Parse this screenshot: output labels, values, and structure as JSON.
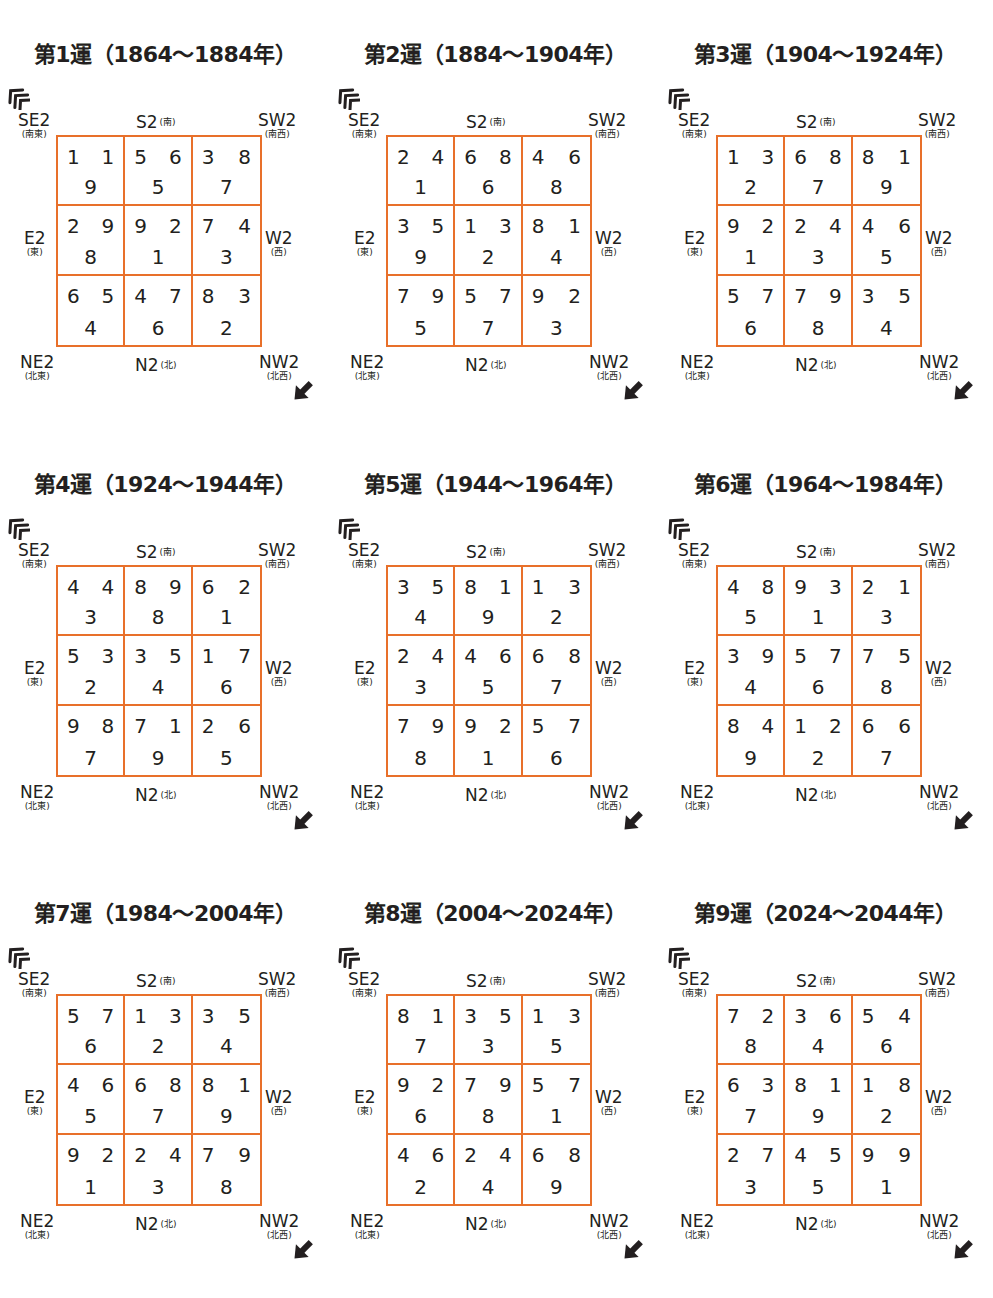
{
  "labels": {
    "se": {
      "en": "SE2",
      "jp": "(南東)"
    },
    "s": {
      "en": "S2",
      "jp": "(南)"
    },
    "sw": {
      "en": "SW2",
      "jp": "(南西)"
    },
    "e": {
      "en": "E2",
      "jp": "(東)"
    },
    "w": {
      "en": "W2",
      "jp": "(西)"
    },
    "ne": {
      "en": "NE2",
      "jp": "(北東)"
    },
    "n": {
      "en": "N2",
      "jp": "(北)"
    },
    "nw": {
      "en": "NW2",
      "jp": "(北西)"
    }
  },
  "colors": {
    "grid_line": "#e8702a",
    "text": "#231f20"
  },
  "icons": {
    "entrance": "entrance-chevron-icon",
    "exit": "diagonal-arrow-icon"
  },
  "periods": [
    {
      "title": "第1運（1864〜1884年）",
      "cells": [
        {
          "m": "1",
          "w": "1",
          "b": "9"
        },
        {
          "m": "5",
          "w": "6",
          "b": "5"
        },
        {
          "m": "3",
          "w": "8",
          "b": "7"
        },
        {
          "m": "2",
          "w": "9",
          "b": "8"
        },
        {
          "m": "9",
          "w": "2",
          "b": "1"
        },
        {
          "m": "7",
          "w": "4",
          "b": "3"
        },
        {
          "m": "6",
          "w": "5",
          "b": "4"
        },
        {
          "m": "4",
          "w": "7",
          "b": "6"
        },
        {
          "m": "8",
          "w": "3",
          "b": "2"
        }
      ]
    },
    {
      "title": "第2運（1884〜1904年）",
      "cells": [
        {
          "m": "2",
          "w": "4",
          "b": "1"
        },
        {
          "m": "6",
          "w": "8",
          "b": "6"
        },
        {
          "m": "4",
          "w": "6",
          "b": "8"
        },
        {
          "m": "3",
          "w": "5",
          "b": "9"
        },
        {
          "m": "1",
          "w": "3",
          "b": "2"
        },
        {
          "m": "8",
          "w": "1",
          "b": "4"
        },
        {
          "m": "7",
          "w": "9",
          "b": "5"
        },
        {
          "m": "5",
          "w": "7",
          "b": "7"
        },
        {
          "m": "9",
          "w": "2",
          "b": "3"
        }
      ]
    },
    {
      "title": "第3運（1904〜1924年）",
      "cells": [
        {
          "m": "1",
          "w": "3",
          "b": "2"
        },
        {
          "m": "6",
          "w": "8",
          "b": "7"
        },
        {
          "m": "8",
          "w": "1",
          "b": "9"
        },
        {
          "m": "9",
          "w": "2",
          "b": "1"
        },
        {
          "m": "2",
          "w": "4",
          "b": "3"
        },
        {
          "m": "4",
          "w": "6",
          "b": "5"
        },
        {
          "m": "5",
          "w": "7",
          "b": "6"
        },
        {
          "m": "7",
          "w": "9",
          "b": "8"
        },
        {
          "m": "3",
          "w": "5",
          "b": "4"
        }
      ]
    },
    {
      "title": "第4運（1924〜1944年）",
      "cells": [
        {
          "m": "4",
          "w": "4",
          "b": "3"
        },
        {
          "m": "8",
          "w": "9",
          "b": "8"
        },
        {
          "m": "6",
          "w": "2",
          "b": "1"
        },
        {
          "m": "5",
          "w": "3",
          "b": "2"
        },
        {
          "m": "3",
          "w": "5",
          "b": "4"
        },
        {
          "m": "1",
          "w": "7",
          "b": "6"
        },
        {
          "m": "9",
          "w": "8",
          "b": "7"
        },
        {
          "m": "7",
          "w": "1",
          "b": "9"
        },
        {
          "m": "2",
          "w": "6",
          "b": "5"
        }
      ]
    },
    {
      "title": "第5運（1944〜1964年）",
      "cells": [
        {
          "m": "3",
          "w": "5",
          "b": "4"
        },
        {
          "m": "8",
          "w": "1",
          "b": "9"
        },
        {
          "m": "1",
          "w": "3",
          "b": "2"
        },
        {
          "m": "2",
          "w": "4",
          "b": "3"
        },
        {
          "m": "4",
          "w": "6",
          "b": "5"
        },
        {
          "m": "6",
          "w": "8",
          "b": "7"
        },
        {
          "m": "7",
          "w": "9",
          "b": "8"
        },
        {
          "m": "9",
          "w": "2",
          "b": "1"
        },
        {
          "m": "5",
          "w": "7",
          "b": "6"
        }
      ]
    },
    {
      "title": "第6運（1964〜1984年）",
      "cells": [
        {
          "m": "4",
          "w": "8",
          "b": "5"
        },
        {
          "m": "9",
          "w": "3",
          "b": "1"
        },
        {
          "m": "2",
          "w": "1",
          "b": "3"
        },
        {
          "m": "3",
          "w": "9",
          "b": "4"
        },
        {
          "m": "5",
          "w": "7",
          "b": "6"
        },
        {
          "m": "7",
          "w": "5",
          "b": "8"
        },
        {
          "m": "8",
          "w": "4",
          "b": "9"
        },
        {
          "m": "1",
          "w": "2",
          "b": "2"
        },
        {
          "m": "6",
          "w": "6",
          "b": "7"
        }
      ]
    },
    {
      "title": "第7運（1984〜2004年）",
      "cells": [
        {
          "m": "5",
          "w": "7",
          "b": "6"
        },
        {
          "m": "1",
          "w": "3",
          "b": "2"
        },
        {
          "m": "3",
          "w": "5",
          "b": "4"
        },
        {
          "m": "4",
          "w": "6",
          "b": "5"
        },
        {
          "m": "6",
          "w": "8",
          "b": "7"
        },
        {
          "m": "8",
          "w": "1",
          "b": "9"
        },
        {
          "m": "9",
          "w": "2",
          "b": "1"
        },
        {
          "m": "2",
          "w": "4",
          "b": "3"
        },
        {
          "m": "7",
          "w": "9",
          "b": "8"
        }
      ]
    },
    {
      "title": "第8運（2004〜2024年）",
      "cells": [
        {
          "m": "8",
          "w": "1",
          "b": "7"
        },
        {
          "m": "3",
          "w": "5",
          "b": "3"
        },
        {
          "m": "1",
          "w": "3",
          "b": "5"
        },
        {
          "m": "9",
          "w": "2",
          "b": "6"
        },
        {
          "m": "7",
          "w": "9",
          "b": "8"
        },
        {
          "m": "5",
          "w": "7",
          "b": "1"
        },
        {
          "m": "4",
          "w": "6",
          "b": "2"
        },
        {
          "m": "2",
          "w": "4",
          "b": "4"
        },
        {
          "m": "6",
          "w": "8",
          "b": "9"
        }
      ]
    },
    {
      "title": "第9運（2024〜2044年）",
      "cells": [
        {
          "m": "7",
          "w": "2",
          "b": "8"
        },
        {
          "m": "3",
          "w": "6",
          "b": "4"
        },
        {
          "m": "5",
          "w": "4",
          "b": "6"
        },
        {
          "m": "6",
          "w": "3",
          "b": "7"
        },
        {
          "m": "8",
          "w": "1",
          "b": "9"
        },
        {
          "m": "1",
          "w": "8",
          "b": "2"
        },
        {
          "m": "2",
          "w": "7",
          "b": "3"
        },
        {
          "m": "4",
          "w": "5",
          "b": "5"
        },
        {
          "m": "9",
          "w": "9",
          "b": "1"
        }
      ]
    }
  ]
}
